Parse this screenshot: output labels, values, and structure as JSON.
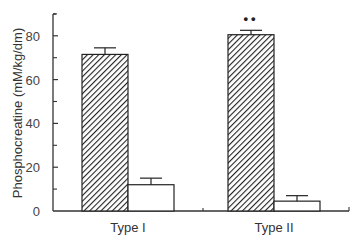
{
  "chart_data": {
    "type": "bar",
    "title": "",
    "xlabel": "",
    "ylabel": "Phosphocreatine (mM/kg/dm)",
    "ylim": [
      0,
      90
    ],
    "yticks": [
      0,
      20,
      40,
      60,
      80
    ],
    "grid": false,
    "legend": null,
    "categories": [
      "Type I",
      "Type II"
    ],
    "series": [
      {
        "name": "hatched",
        "pattern": "diagonal-hatch",
        "values": [
          71.5,
          80.5
        ],
        "errors": [
          3,
          2
        ],
        "annotations": [
          "",
          "**"
        ]
      },
      {
        "name": "open",
        "pattern": "none",
        "values": [
          12,
          4.5
        ],
        "errors": [
          3,
          2.5
        ],
        "annotations": [
          "",
          ""
        ]
      }
    ]
  },
  "colors": {
    "axis": "#333333",
    "hatch": "#222222",
    "bar_fill": "#ffffff"
  }
}
